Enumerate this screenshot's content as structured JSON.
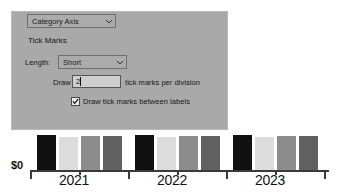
{
  "dialog": {
    "axis_select": {
      "value": "Category Axis",
      "chevron": "chevron-down-icon"
    },
    "section_title": "Tick Marks",
    "length_label": "Length:",
    "length_select": {
      "value": "Short",
      "chevron": "chevron-down-icon"
    },
    "draw_prefix_label": "Draw",
    "draw_count_value": "2",
    "draw_suffix_label": "tick marks per division",
    "between_labels_checkbox": {
      "label": "Draw tick marks between labels",
      "checked": true
    },
    "colors": {
      "panel_background": "#a9a9a9",
      "panel_border": "#b9b9b9",
      "control_background": "#ababab",
      "input_background": "#cfcfcf",
      "text": "#161616"
    }
  },
  "chart_data": {
    "type": "bar",
    "title": "",
    "xlabel": "",
    "ylabel": "",
    "categories": [
      "2021",
      "2022",
      "2023"
    ],
    "series": [
      {
        "name": "Series 1",
        "color": "#111111",
        "values": [
          93,
          93,
          93
        ]
      },
      {
        "name": "Series 2",
        "color": "#dcdcdc",
        "values": [
          88,
          88,
          88
        ]
      },
      {
        "name": "Series 3",
        "color": "#8c8c8c",
        "values": [
          90,
          90,
          90
        ]
      },
      {
        "name": "Series 4",
        "color": "#606060",
        "values": [
          90,
          90,
          90
        ]
      }
    ],
    "ylim": [
      0,
      100
    ],
    "y_tick_labels": [
      "$0"
    ],
    "grid": false,
    "legend": "none",
    "axis_color": "#3a3a3a",
    "tick_marks_between_labels": true,
    "tick_marks_per_division": 2
  }
}
